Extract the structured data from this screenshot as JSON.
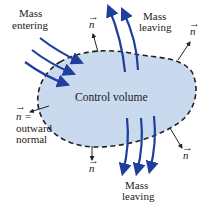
{
  "diagram": {
    "control_volume_label": "Control volume",
    "mass_entering": [
      "Mass",
      "entering"
    ],
    "mass_leaving_top": [
      "Mass",
      "leaving"
    ],
    "mass_leaving_bottom": [
      "Mass",
      "leaving"
    ],
    "normal_symbol": "n",
    "normal_arrow": "→",
    "outward_normal": [
      "n =",
      "outward",
      "normal"
    ],
    "colors": {
      "volume_fill": "#c9d9ee",
      "boundary": "#222222",
      "flow_arrow": "#1f3f9c",
      "normal_arrow": "#222222"
    }
  }
}
